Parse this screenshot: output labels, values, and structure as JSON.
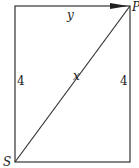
{
  "diagram": {
    "type": "geometry-rectangle-with-diagonal",
    "labels": {
      "top_edge": "y",
      "diagonal": "x",
      "left_edge": "4",
      "right_edge": "4",
      "vertex_bottom_left": "S",
      "vertex_top_right": "P"
    },
    "arrow": "on top edge pointing toward P",
    "colors": {
      "stroke": "#333333",
      "background": "#ffffff"
    }
  }
}
